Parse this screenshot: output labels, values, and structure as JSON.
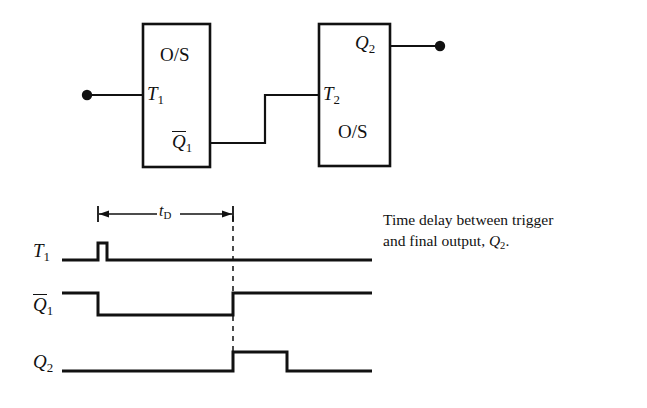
{
  "figure": {
    "type": "monostable-cascade-timing-diagram",
    "background_color": "#ffffff",
    "ink_color": "#111111"
  },
  "circuit": {
    "block1": {
      "body_label": "O/S",
      "input_label": "T",
      "input_label_sub": "1",
      "output_label": "Q",
      "output_label_sub": "1",
      "output_label_overbar": true
    },
    "block2": {
      "body_label": "O/S",
      "input_label": "T",
      "input_label_sub": "2",
      "output_label": "Q",
      "output_label_sub": "2",
      "output_label_overbar": false
    },
    "terminals": {
      "input_dot": "input-terminal",
      "output_dot": "output-terminal"
    }
  },
  "timing": {
    "delay_label": "t",
    "delay_label_sub": "D",
    "signals": [
      {
        "name": "T",
        "sub": "1",
        "overbar": false,
        "description": "narrow trigger pulse at start",
        "waveform": "low-pulse-low"
      },
      {
        "name": "Q",
        "sub": "1",
        "overbar": true,
        "description": "goes low on trigger, returns high after t_D",
        "waveform": "high-low-high"
      },
      {
        "name": "Q",
        "sub": "2",
        "overbar": false,
        "description": "pulse begins after t_D delay",
        "waveform": "low-pulse-low"
      }
    ]
  },
  "caption": {
    "line1": "Time delay between trigger",
    "line2_pre": "and final output, ",
    "line2_var": "Q",
    "line2_sub": "2",
    "line2_post": "."
  }
}
